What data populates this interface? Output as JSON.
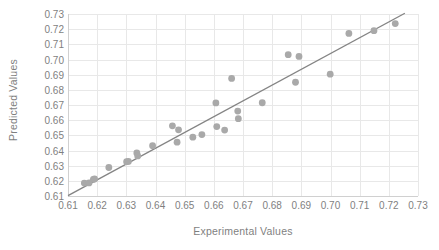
{
  "chart_data": {
    "type": "scatter",
    "title": "",
    "xlabel": "Experimental Values",
    "ylabel": "Predicted Values",
    "xlim": [
      0.61,
      0.73
    ],
    "ylim": [
      0.61,
      0.73
    ],
    "xticks": [
      "0.61",
      "0.62",
      "0.63",
      "0.64",
      "0.65",
      "0.66",
      "0.67",
      "0.68",
      "0.69",
      "0.70",
      "0.71",
      "0.72",
      "0.73"
    ],
    "yticks": [
      "0.61",
      "0.62",
      "0.63",
      "0.64",
      "0.65",
      "0.66",
      "0.67",
      "0.68",
      "0.69",
      "0.70",
      "0.71",
      "0.72",
      "0.73"
    ],
    "grid": true,
    "legend": "none",
    "marker_color": "#a9a9a9",
    "line_color": "#848484",
    "gridline_color": "#e8e8e8",
    "text_color": "#7f7f7f",
    "series": [
      {
        "name": "Predicted vs Experimental",
        "points": [
          [
            0.6156,
            0.6185
          ],
          [
            0.6172,
            0.6186
          ],
          [
            0.6187,
            0.621
          ],
          [
            0.6191,
            0.6212
          ],
          [
            0.624,
            0.6288
          ],
          [
            0.6301,
            0.6326
          ],
          [
            0.6307,
            0.6328
          ],
          [
            0.6336,
            0.6384
          ],
          [
            0.6339,
            0.6364
          ],
          [
            0.639,
            0.6432
          ],
          [
            0.6458,
            0.6563
          ],
          [
            0.6474,
            0.6455
          ],
          [
            0.6479,
            0.6536
          ],
          [
            0.6528,
            0.6488
          ],
          [
            0.6559,
            0.6505
          ],
          [
            0.6607,
            0.6714
          ],
          [
            0.661,
            0.6558
          ],
          [
            0.6637,
            0.6535
          ],
          [
            0.6661,
            0.6875
          ],
          [
            0.6682,
            0.666
          ],
          [
            0.6684,
            0.661
          ],
          [
            0.6766,
            0.6715
          ],
          [
            0.6855,
            0.7032
          ],
          [
            0.688,
            0.685
          ],
          [
            0.6892,
            0.702
          ],
          [
            0.6999,
            0.6903
          ],
          [
            0.7063,
            0.7172
          ],
          [
            0.7149,
            0.719
          ],
          [
            0.7222,
            0.7237
          ]
        ]
      }
    ],
    "trend_line": {
      "name": "linear fit",
      "x0": 0.61,
      "y0": 0.6102,
      "x1": 0.7255,
      "y1": 0.7305
    }
  }
}
